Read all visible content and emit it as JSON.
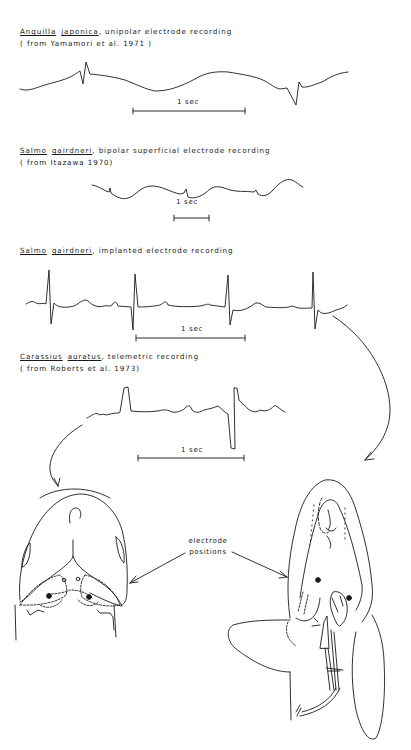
{
  "figure": {
    "panels": [
      {
        "species_genus": "Anguilla",
        "species_name": "japonica",
        "description": ", unipolar electrode recording",
        "source": "( from  Yamamori  et  al.  1971 )",
        "scale_label": "1 sec"
      },
      {
        "species_genus": "Salmo",
        "species_name": "gairdneri",
        "description": ", bipolar  superficial  electrode  recording",
        "source": "( from  Itazawa  1970)",
        "scale_label": "1 sec"
      },
      {
        "species_genus": "Salmo",
        "species_name": "gairdneri",
        "description": ", implanted  electrode  recording",
        "source": "",
        "scale_label": "1 sec"
      },
      {
        "species_genus": "Carassius",
        "species_name": "auratus",
        "description": ", telemetric  recording",
        "source": "( from  Roberts  et  al.  1973)",
        "scale_label": "1 sec"
      }
    ],
    "annotation": {
      "line1": "electrode",
      "line2": "positions"
    },
    "colors": {
      "ink": "#1a1a1a",
      "background": "#ffffff"
    }
  }
}
